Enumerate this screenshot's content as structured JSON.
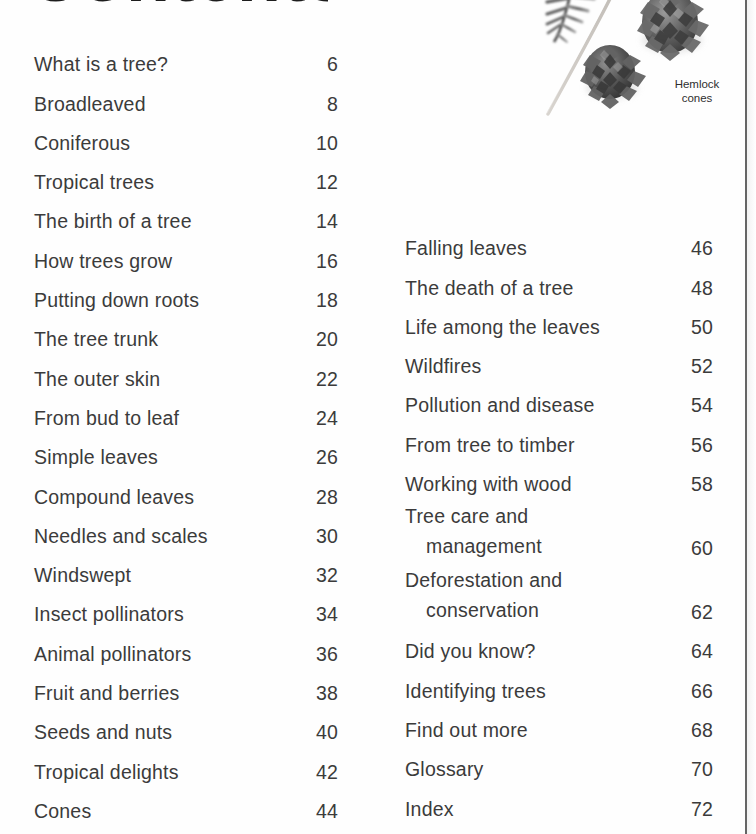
{
  "page": {
    "title": "Contents",
    "title_cropped": true,
    "background_color": "#ffffff",
    "text_color": "#3b3b3b",
    "gutter_line_color": "#4a4a4a"
  },
  "illustration": {
    "name": "hemlock-branch-and-cones-photo",
    "caption_line1": "Hemlock",
    "caption_line2": "cones",
    "caption": "Hemlock cones"
  },
  "toc": {
    "left_column": [
      {
        "label": "What is a tree?",
        "page": "6"
      },
      {
        "label": "Broadleaved",
        "page": "8"
      },
      {
        "label": "Coniferous",
        "page": "10"
      },
      {
        "label": "Tropical trees",
        "page": "12"
      },
      {
        "label": "The birth of a tree",
        "page": "14"
      },
      {
        "label": "How trees grow",
        "page": "16"
      },
      {
        "label": "Putting down roots",
        "page": "18"
      },
      {
        "label": "The tree trunk",
        "page": "20"
      },
      {
        "label": "The outer skin",
        "page": "22"
      },
      {
        "label": "From bud to leaf",
        "page": "24"
      },
      {
        "label": "Simple leaves",
        "page": "26"
      },
      {
        "label": "Compound leaves",
        "page": "28"
      },
      {
        "label": "Needles and scales",
        "page": "30"
      },
      {
        "label": "Windswept",
        "page": "32"
      },
      {
        "label": "Insect pollinators",
        "page": "34"
      },
      {
        "label": "Animal pollinators",
        "page": "36"
      },
      {
        "label": "Fruit and berries",
        "page": "38"
      },
      {
        "label": "Seeds and nuts",
        "page": "40"
      },
      {
        "label": "Tropical delights",
        "page": "42"
      },
      {
        "label": "Cones",
        "page": "44"
      }
    ],
    "right_column": [
      {
        "label": "Falling leaves",
        "page": "46"
      },
      {
        "label": "The death of a tree",
        "page": "48"
      },
      {
        "label": "Life among the leaves",
        "page": "50"
      },
      {
        "label": "Wildfires",
        "page": "52"
      },
      {
        "label": "Pollution and disease",
        "page": "54"
      },
      {
        "label": "From tree to timber",
        "page": "56"
      },
      {
        "label": "Working with wood",
        "page": "58"
      },
      {
        "label": "Tree care and",
        "label_cont": "management",
        "page": "60"
      },
      {
        "label": "Deforestation and",
        "label_cont": "conservation",
        "page": "62"
      },
      {
        "label": "Did you know?",
        "page": "64"
      },
      {
        "label": "Identifying trees",
        "page": "66"
      },
      {
        "label": "Find out more",
        "page": "68"
      },
      {
        "label": "Glossary",
        "page": "70"
      },
      {
        "label": "Index",
        "page": "72"
      }
    ]
  }
}
